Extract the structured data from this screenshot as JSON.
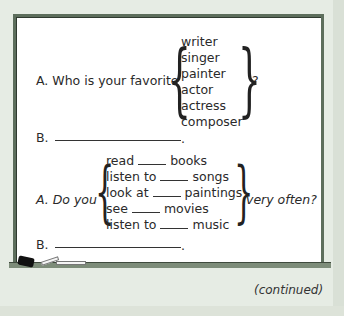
{
  "exercise": {
    "q1": {
      "a_prefix": "A.  Who is your favorite",
      "options": [
        "writer",
        "singer",
        "painter",
        "actor",
        "actress",
        "composer"
      ],
      "suffix": "?",
      "b_label": "B.",
      "b_end": "."
    },
    "q2": {
      "a_prefix": "A.  Do you",
      "options": [
        {
          "verb": "read",
          "noun": "books"
        },
        {
          "verb": "listen to",
          "noun": "songs"
        },
        {
          "verb": "look at",
          "noun": "paintings"
        },
        {
          "verb": "see",
          "noun": "movies"
        },
        {
          "verb": "listen to",
          "noun": "music"
        }
      ],
      "suffix": "very often?",
      "b_label": "B.",
      "b_end": "."
    }
  },
  "footer": {
    "continued": "(continued)"
  },
  "colors": {
    "background": "#e6ece4",
    "frame": "#5d6e5c",
    "board": "#ffffff",
    "tray": "#7d8c79"
  }
}
